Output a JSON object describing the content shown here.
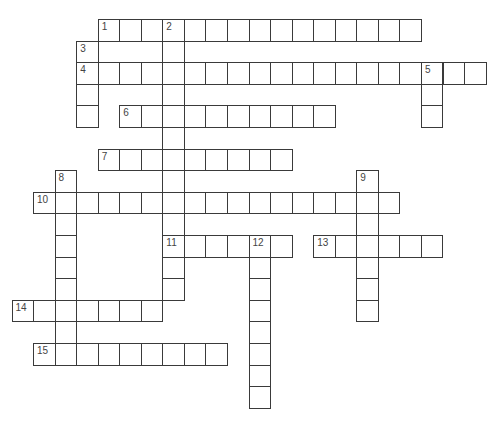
{
  "puzzle": {
    "type": "crossword",
    "grid": {
      "origin_x": 11.5,
      "origin_y": 19,
      "cell_w": 21.55,
      "cell_h": 21.6
    },
    "colors": {
      "line": "#3a3a3a",
      "number": "#444444",
      "background": "#ffffff"
    },
    "entries": [
      {
        "number": "1",
        "direction": "across",
        "col": 4,
        "row": 0,
        "length": 15
      },
      {
        "number": "2",
        "direction": "down",
        "col": 7,
        "row": 0,
        "length": 13
      },
      {
        "number": "3",
        "direction": "down",
        "col": 3,
        "row": 1,
        "length": 4
      },
      {
        "number": "4",
        "direction": "across",
        "col": 3,
        "row": 2,
        "length": 19
      },
      {
        "number": "5",
        "direction": "down",
        "col": 19,
        "row": 2,
        "length": 3
      },
      {
        "number": "6",
        "direction": "across",
        "col": 5,
        "row": 4,
        "length": 10
      },
      {
        "number": "7",
        "direction": "across",
        "col": 4,
        "row": 6,
        "length": 9
      },
      {
        "number": "8",
        "direction": "down",
        "col": 2,
        "row": 7,
        "length": 9
      },
      {
        "number": "9",
        "direction": "down",
        "col": 16,
        "row": 7,
        "length": 7
      },
      {
        "number": "10",
        "direction": "across",
        "col": 1,
        "row": 8,
        "length": 17
      },
      {
        "number": "11",
        "direction": "across",
        "col": 7,
        "row": 10,
        "length": 6
      },
      {
        "number": "12",
        "direction": "down",
        "col": 11,
        "row": 10,
        "length": 8
      },
      {
        "number": "13",
        "direction": "across",
        "col": 14,
        "row": 10,
        "length": 6
      },
      {
        "number": "14",
        "direction": "across",
        "col": 0,
        "row": 13,
        "length": 7
      },
      {
        "number": "15",
        "direction": "across",
        "col": 1,
        "row": 15,
        "length": 9
      }
    ]
  }
}
